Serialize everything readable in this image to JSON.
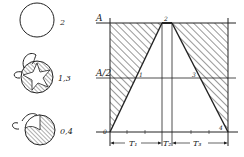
{
  "left_panel": {
    "states": [
      {
        "label": "2",
        "description": "open circle (empty)"
      },
      {
        "label": "1,3",
        "description": "hatched circle with star-shaped open center and loop"
      },
      {
        "label": "0,4",
        "description": "hatched circle with sector open and loop"
      }
    ]
  },
  "diagram": {
    "y_axis_labels": {
      "top": "A",
      "mid": "A/2"
    },
    "point_labels": {
      "p0": "0",
      "p1": "1",
      "p2": "2",
      "p3": "3",
      "p4": "4"
    },
    "interval_labels": {
      "t1": "T₁",
      "t2": "T₂",
      "t3": "T₃"
    },
    "colors": {
      "ink": "#222222",
      "background": "#ffffff"
    }
  }
}
